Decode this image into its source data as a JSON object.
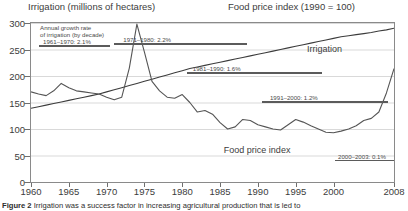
{
  "header": {
    "left_title": "Irrigation (millions of hectares)",
    "right_title": "Food price index (1990 = 100)"
  },
  "caption": {
    "label": "Figure 2",
    "text": "Irrigation was a success factor in increasing agricultural production that is led to"
  },
  "annotations": {
    "intro_line1": "Annual growth rate",
    "intro_line2": "of irrigation (by decade)",
    "decades": [
      {
        "label": "1961–1970: 2.1%"
      },
      {
        "label": "1971–1980: 2.2%"
      },
      {
        "label": "1981–1990: 1.6%"
      },
      {
        "label": "1991–2000: 1.2%"
      },
      {
        "label": "2000–2003: 0.1%"
      }
    ]
  },
  "series_labels": {
    "irrigation": "Irrigation",
    "food_price_index": "Food price index"
  },
  "chart_data": {
    "type": "line",
    "title": "",
    "xlabel": "",
    "ylabel": "",
    "xlim": [
      1960,
      2008
    ],
    "ylim": [
      0,
      300
    ],
    "grid": true,
    "legend_position": "inline-labels",
    "xticks": [
      1960,
      1965,
      1970,
      1975,
      1980,
      1985,
      1990,
      1995,
      2000,
      2008
    ],
    "yticks": [
      0,
      50,
      100,
      150,
      200,
      250,
      300
    ],
    "colors": {
      "irrigation": "#3c3c3c",
      "food_price_index": "#555555",
      "grid": "#d9d9d9",
      "frame": "#8a8a8a"
    },
    "series": [
      {
        "name": "Irrigation",
        "units": "millions of hectares",
        "x": [
          1960,
          1961,
          1962,
          1963,
          1964,
          1965,
          1966,
          1967,
          1968,
          1969,
          1970,
          1971,
          1972,
          1973,
          1974,
          1975,
          1976,
          1977,
          1978,
          1979,
          1980,
          1981,
          1982,
          1983,
          1984,
          1985,
          1986,
          1987,
          1988,
          1989,
          1990,
          1991,
          1992,
          1993,
          1994,
          1995,
          1996,
          1997,
          1998,
          1999,
          2000,
          2001,
          2002,
          2003,
          2004,
          2005,
          2006,
          2007,
          2008
        ],
        "values": [
          139,
          142,
          145,
          148,
          151,
          154,
          157,
          160,
          163,
          166,
          170,
          174,
          178,
          182,
          186,
          190,
          194,
          198,
          202,
          206,
          210,
          214,
          217,
          220,
          223,
          226,
          229,
          232,
          235,
          238,
          241,
          244,
          247,
          250,
          253,
          256,
          259,
          262,
          265,
          268,
          271,
          274,
          276,
          278,
          280,
          282,
          285,
          287,
          290
        ]
      },
      {
        "name": "Food price index",
        "units": "1990 = 100",
        "x": [
          1960,
          1961,
          1962,
          1963,
          1964,
          1965,
          1966,
          1967,
          1968,
          1969,
          1970,
          1971,
          1972,
          1973,
          1974,
          1975,
          1976,
          1977,
          1978,
          1979,
          1980,
          1981,
          1982,
          1983,
          1984,
          1985,
          1986,
          1987,
          1988,
          1989,
          1990,
          1991,
          1992,
          1993,
          1994,
          1995,
          1996,
          1997,
          1998,
          1999,
          2000,
          2001,
          2002,
          2003,
          2004,
          2005,
          2006,
          2007,
          2008
        ],
        "values": [
          170,
          166,
          163,
          172,
          186,
          178,
          172,
          170,
          168,
          166,
          160,
          155,
          160,
          215,
          298,
          245,
          190,
          172,
          160,
          158,
          165,
          150,
          132,
          135,
          128,
          112,
          100,
          104,
          118,
          116,
          108,
          104,
          100,
          98,
          108,
          118,
          113,
          106,
          100,
          94,
          93,
          96,
          100,
          106,
          116,
          120,
          132,
          168,
          214
        ]
      }
    ],
    "annotation_growth_rates": [
      {
        "period": "1961–1970",
        "rate_percent": 2.1
      },
      {
        "period": "1971–1980",
        "rate_percent": 2.2
      },
      {
        "period": "1981–1990",
        "rate_percent": 1.6
      },
      {
        "period": "1991–2000",
        "rate_percent": 1.2
      },
      {
        "period": "2000–2003",
        "rate_percent": 0.1
      }
    ]
  }
}
